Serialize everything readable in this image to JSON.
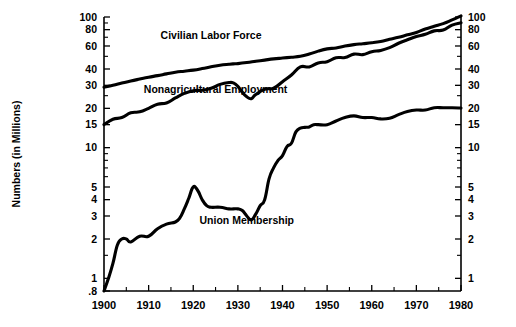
{
  "chart_data": {
    "type": "line",
    "title": "",
    "subtitle": "",
    "xlabel": "",
    "ylabel": "Numbers (in Millions)",
    "scale": "log",
    "grid": false,
    "legend_position": "inline-annotations",
    "xlim": [
      1900,
      1980
    ],
    "ylim": [
      0.8,
      100
    ],
    "x_ticks": [
      1900,
      1910,
      1920,
      1930,
      1940,
      1950,
      1960,
      1970,
      1980
    ],
    "x_tick_labels": [
      "1900",
      "1910",
      "1920",
      "1930",
      "1940",
      "1950",
      "1960",
      "1970",
      "1980"
    ],
    "x_minor_ticks": [
      1905,
      1915,
      1925,
      1935,
      1945,
      1955,
      1965,
      1975
    ],
    "y_ticks_left": [
      100,
      80,
      60,
      40,
      30,
      20,
      15,
      10,
      5,
      4,
      3,
      2,
      1,
      0.8
    ],
    "y_tick_labels_left": [
      "100",
      "80",
      "60",
      "40",
      "30",
      "20",
      "15",
      "10",
      "5",
      "4",
      "3",
      "2",
      "1",
      ".8"
    ],
    "y_ticks_right": [
      100,
      80,
      60,
      40,
      30,
      20,
      15,
      10,
      5,
      4,
      3,
      2,
      1
    ],
    "y_tick_labels_right": [
      "100",
      "80",
      "60",
      "40",
      "30",
      "20",
      "15",
      "10",
      "5",
      "4",
      "3",
      "2",
      "1"
    ],
    "y_minor_ticks_left": [
      90,
      70,
      50,
      25,
      9,
      8,
      7,
      6,
      1.5
    ],
    "y_minor_ticks_right": [
      90,
      70,
      50,
      25,
      9,
      8,
      7,
      6,
      1.5
    ],
    "series": [
      {
        "name": "Civilian Labor Force",
        "label": "Civilian Labor Force",
        "label_x": 1924,
        "label_y": 68,
        "x": [
          1900,
          1902,
          1904,
          1906,
          1908,
          1910,
          1912,
          1914,
          1916,
          1918,
          1920,
          1922,
          1924,
          1926,
          1928,
          1929,
          1930,
          1932,
          1934,
          1936,
          1938,
          1940,
          1942,
          1944,
          1946,
          1948,
          1950,
          1952,
          1954,
          1956,
          1958,
          1960,
          1962,
          1964,
          1966,
          1968,
          1970,
          1972,
          1974,
          1976,
          1978,
          1980
        ],
        "values": [
          29.0,
          30.0,
          31.2,
          32.4,
          33.5,
          34.6,
          35.6,
          36.7,
          37.8,
          38.5,
          39.2,
          40.3,
          41.6,
          42.8,
          43.5,
          43.8,
          44.0,
          44.8,
          45.8,
          46.8,
          47.8,
          48.5,
          49.2,
          50.0,
          52.0,
          54.8,
          57.0,
          58.0,
          60.0,
          61.5,
          62.5,
          63.5,
          65.0,
          67.5,
          70.0,
          73.0,
          76.0,
          81.0,
          85.0,
          89.0,
          95.0,
          102.0
        ],
        "unit": "millions"
      },
      {
        "name": "Nonagricultural Employment",
        "label": "Nonagricultural Employment",
        "label_x": 1925,
        "label_y": 26,
        "x": [
          1900,
          1902,
          1904,
          1906,
          1908,
          1910,
          1912,
          1914,
          1916,
          1918,
          1920,
          1922,
          1924,
          1926,
          1928,
          1929,
          1930,
          1931,
          1932,
          1933,
          1934,
          1936,
          1938,
          1940,
          1942,
          1944,
          1946,
          1948,
          1950,
          1952,
          1954,
          1956,
          1958,
          1960,
          1962,
          1964,
          1966,
          1968,
          1970,
          1972,
          1974,
          1976,
          1978,
          1980
        ],
        "values": [
          15.0,
          16.5,
          17.0,
          18.5,
          18.8,
          20.0,
          21.5,
          22.0,
          24.0,
          26.0,
          27.3,
          27.5,
          28.5,
          30.5,
          31.5,
          31.3,
          29.5,
          26.5,
          24.5,
          23.7,
          25.5,
          28.0,
          28.5,
          32.0,
          36.0,
          41.5,
          41.5,
          44.5,
          45.5,
          48.8,
          49.0,
          52.0,
          51.5,
          54.2,
          55.5,
          58.3,
          63.0,
          67.0,
          70.9,
          73.7,
          78.3,
          79.4,
          86.7,
          90.4
        ],
        "unit": "millions"
      },
      {
        "name": "Union Membership",
        "label": "Union Membership",
        "label_x": 1932,
        "label_y": 2.6,
        "x": [
          1900,
          1901,
          1902,
          1903,
          1904,
          1905,
          1906,
          1908,
          1910,
          1912,
          1914,
          1916,
          1917,
          1918,
          1919,
          1920,
          1921,
          1922,
          1923,
          1924,
          1926,
          1928,
          1929,
          1930,
          1931,
          1932,
          1933,
          1934,
          1935,
          1936,
          1937,
          1938,
          1939,
          1940,
          1941,
          1942,
          1943,
          1944,
          1945,
          1946,
          1947,
          1948,
          1950,
          1952,
          1954,
          1956,
          1958,
          1960,
          1962,
          1964,
          1966,
          1968,
          1970,
          1972,
          1974,
          1976,
          1978,
          1980
        ],
        "values": [
          0.8,
          1.0,
          1.3,
          1.8,
          2.0,
          2.0,
          1.9,
          2.1,
          2.1,
          2.4,
          2.6,
          2.7,
          2.9,
          3.4,
          4.1,
          5.0,
          4.7,
          4.0,
          3.6,
          3.5,
          3.5,
          3.4,
          3.4,
          3.4,
          3.3,
          3.0,
          2.8,
          3.1,
          3.6,
          4.0,
          5.8,
          7.0,
          8.0,
          8.7,
          10.2,
          10.8,
          13.2,
          14.1,
          14.3,
          14.4,
          15.0,
          15.0,
          15.0,
          16.0,
          17.0,
          17.5,
          17.0,
          17.0,
          16.6,
          16.8,
          17.9,
          18.9,
          19.4,
          19.4,
          20.2,
          20.2,
          20.2,
          20.1
        ],
        "unit": "millions"
      }
    ]
  },
  "axis": {
    "y_title": "Numbers (in Millions)"
  }
}
